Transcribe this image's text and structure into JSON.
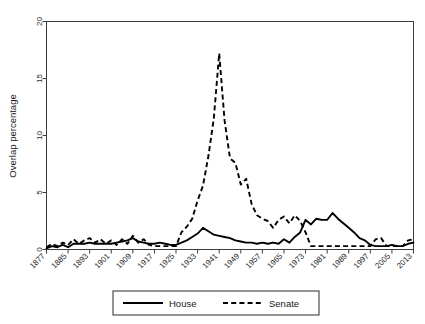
{
  "chart_data": {
    "type": "line",
    "title": "",
    "xlabel": "",
    "ylabel": "Overlap percentage",
    "xlim": [
      1877,
      2013
    ],
    "ylim": [
      0,
      20
    ],
    "grid": false,
    "legend_position": "bottom",
    "ytick_labels": [
      "0",
      "5",
      "10",
      "15",
      "20"
    ],
    "ytick_values": [
      0,
      5,
      10,
      15,
      20
    ],
    "xtick_labels": [
      "1877",
      "1885",
      "1893",
      "1901",
      "1909",
      "1917",
      "1925",
      "1933",
      "1941",
      "1949",
      "1957",
      "1965",
      "1973",
      "1981",
      "1989",
      "1997",
      "2005",
      "2013"
    ],
    "xtick_values": [
      1877,
      1885,
      1893,
      1901,
      1909,
      1917,
      1925,
      1933,
      1941,
      1949,
      1957,
      1965,
      1973,
      1981,
      1989,
      1997,
      2005,
      2013
    ],
    "x": [
      1877,
      1879,
      1881,
      1883,
      1885,
      1887,
      1889,
      1891,
      1893,
      1895,
      1897,
      1899,
      1901,
      1903,
      1905,
      1907,
      1909,
      1911,
      1913,
      1915,
      1917,
      1919,
      1921,
      1923,
      1925,
      1927,
      1929,
      1931,
      1933,
      1935,
      1937,
      1939,
      1941,
      1943,
      1945,
      1947,
      1949,
      1951,
      1953,
      1955,
      1957,
      1959,
      1961,
      1963,
      1965,
      1967,
      1969,
      1971,
      1973,
      1975,
      1977,
      1979,
      1981,
      1983,
      1985,
      1987,
      1989,
      1991,
      1993,
      1995,
      1997,
      1999,
      2001,
      2003,
      2005,
      2007,
      2009,
      2011,
      2013
    ],
    "series": [
      {
        "name": "House",
        "style": "solid",
        "color": "#000000",
        "values": [
          0.1,
          0.3,
          0.2,
          0.4,
          0.2,
          0.5,
          0.5,
          0.5,
          0.6,
          0.5,
          0.5,
          0.5,
          0.5,
          0.6,
          0.7,
          0.8,
          1.0,
          0.7,
          0.6,
          0.5,
          0.5,
          0.6,
          0.5,
          0.4,
          0.4,
          0.6,
          0.8,
          1.1,
          1.4,
          1.9,
          1.6,
          1.3,
          1.2,
          1.1,
          1.0,
          0.8,
          0.7,
          0.6,
          0.6,
          0.5,
          0.6,
          0.5,
          0.6,
          0.5,
          0.9,
          0.6,
          1.1,
          1.5,
          2.6,
          2.2,
          2.7,
          2.6,
          2.6,
          3.2,
          2.7,
          2.3,
          1.9,
          1.5,
          1.0,
          0.8,
          0.4,
          0.3,
          0.3,
          0.3,
          0.4,
          0.3,
          0.3,
          0.5,
          0.6
        ]
      },
      {
        "name": "Senate",
        "style": "dashed",
        "color": "#000000",
        "values": [
          0.2,
          0.5,
          0.3,
          0.6,
          0.4,
          0.9,
          0.5,
          0.8,
          1.0,
          0.6,
          0.9,
          0.5,
          0.8,
          0.4,
          0.9,
          0.5,
          1.2,
          0.6,
          0.9,
          0.4,
          0.3,
          0.3,
          0.3,
          0.3,
          0.3,
          1.5,
          2.0,
          2.7,
          4.3,
          5.6,
          8.2,
          11.5,
          17.2,
          11.3,
          8.0,
          7.6,
          5.7,
          6.2,
          4.0,
          3.0,
          2.7,
          2.5,
          1.9,
          2.6,
          2.9,
          2.3,
          3.0,
          2.5,
          1.5,
          0.3,
          0.3,
          0.3,
          0.3,
          0.3,
          0.3,
          0.3,
          0.3,
          0.3,
          0.3,
          0.3,
          0.3,
          0.9,
          1.0,
          0.3,
          0.3,
          0.3,
          0.3,
          0.8,
          0.9
        ]
      }
    ]
  },
  "legend": {
    "items": [
      {
        "label": "House",
        "style": "solid"
      },
      {
        "label": "Senate",
        "style": "dashed"
      }
    ]
  }
}
